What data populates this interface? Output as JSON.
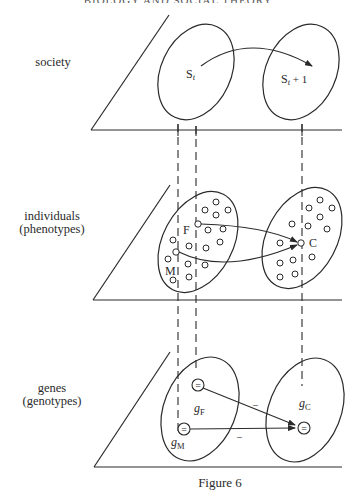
{
  "header": {
    "running_head": "BIOLOGY AND SOCIAL THEORY"
  },
  "caption": "Figure 6",
  "levels": [
    {
      "id": "society",
      "label_line1": "society",
      "label_line2": ""
    },
    {
      "id": "individuals",
      "label_line1": "individuals",
      "label_line2": "(phenotypes)"
    },
    {
      "id": "genes",
      "label_line1": "genes",
      "label_line2": "(genotypes)"
    }
  ],
  "society": {
    "left_node": {
      "main": "S",
      "sub": "t"
    },
    "right_node": {
      "main": "S",
      "sub": "t",
      "suffix": " + 1"
    }
  },
  "individuals": {
    "father_label": "F",
    "mother_label": "M",
    "child_label": "C"
  },
  "genes": {
    "father": {
      "main": "g",
      "sub": "F"
    },
    "mother": {
      "main": "g",
      "sub": "M"
    },
    "child": {
      "main": "g",
      "sub": "C"
    },
    "gene_symbol": "=",
    "arrow_mark": "–"
  },
  "colors": {
    "ink": "#2a2a2a",
    "background": "#ffffff"
  }
}
